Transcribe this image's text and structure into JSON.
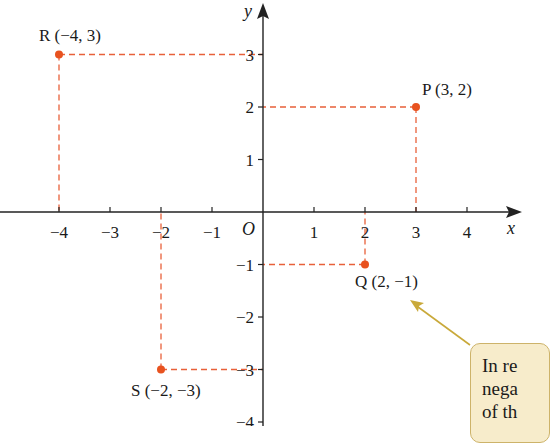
{
  "axes": {
    "x_label": "x",
    "y_label": "y",
    "origin_label": "O",
    "x_ticks": [
      -4,
      -3,
      -2,
      -1,
      1,
      2,
      3,
      4
    ],
    "x_tick_labels": [
      "−4",
      "−3",
      "−2",
      "−1",
      "1",
      "2",
      "3",
      "4"
    ],
    "y_ticks": [
      3,
      2,
      1,
      -1,
      -2,
      -3,
      -4
    ],
    "y_tick_labels": [
      "3",
      "2",
      "1",
      "−1",
      "−2",
      "−3",
      "−4"
    ]
  },
  "points": [
    {
      "name": "P",
      "x": 3,
      "y": 2,
      "label": "P (3, 2)"
    },
    {
      "name": "Q",
      "x": 2,
      "y": -1,
      "label": "Q (2, −1)"
    },
    {
      "name": "R",
      "x": -4,
      "y": 3,
      "label": "R (−4, 3)"
    },
    {
      "name": "S",
      "x": -2,
      "y": -3,
      "label": "S (−2, −3)"
    }
  ],
  "annotation": {
    "lines": [
      "In re",
      "nega",
      "of th"
    ]
  },
  "colors": {
    "point": "#e8521f",
    "guide": "#e8603a",
    "axis": "#222222",
    "note_bg": "#f7eccb",
    "note_border": "#cdb36a",
    "arrow": "#c9a93a"
  },
  "chart_data": {
    "type": "scatter",
    "title": "",
    "xlabel": "x",
    "ylabel": "y",
    "xlim": [
      -4.8,
      5
    ],
    "ylim": [
      -4,
      4
    ],
    "grid": false,
    "points": [
      {
        "label": "P",
        "x": 3,
        "y": 2
      },
      {
        "label": "Q",
        "x": 2,
        "y": -1
      },
      {
        "label": "R",
        "x": -4,
        "y": 3
      },
      {
        "label": "S",
        "x": -2,
        "y": -3
      }
    ],
    "annotations": [
      "P (3, 2)",
      "Q (2, −1)",
      "R (−4, 3)",
      "S (−2, −3)",
      "In re / nega / of th (cropped callout pointing to Q)"
    ]
  }
}
